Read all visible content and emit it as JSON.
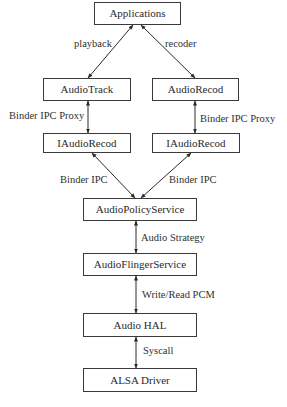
{
  "diagram": {
    "type": "architecture-stack",
    "nodes": {
      "applications": "Applications",
      "audio_track": "AudioTrack",
      "audio_record": "AudioRecod",
      "iaudio_record_left": "IAudioRecod",
      "iaudio_record_right": "IAudioRecod",
      "audio_policy_service": "AudioPolicyService",
      "audio_flinger_service": "AudioFlingerService",
      "audio_hal": "Audio HAL",
      "alsa_driver": "ALSA Driver"
    },
    "edges": {
      "playback": "playback",
      "recoder": "recoder",
      "binder_ipc_proxy_left": "Binder IPC Proxy",
      "binder_ipc_proxy_right": "Binder IPC Proxy",
      "binder_ipc_left": "Binder IPC",
      "binder_ipc_right": "Binder IPC",
      "audio_strategy": "Audio Strategy",
      "write_read_pcm": "Write/Read PCM",
      "syscall": "Syscall"
    },
    "connections": [
      {
        "from": "applications",
        "to": "audio_track",
        "label": "playback",
        "bidirectional": true
      },
      {
        "from": "applications",
        "to": "audio_record",
        "label": "recoder",
        "bidirectional": true
      },
      {
        "from": "audio_track",
        "to": "iaudio_record_left",
        "label": "Binder IPC Proxy",
        "bidirectional": true
      },
      {
        "from": "audio_record",
        "to": "iaudio_record_right",
        "label": "Binder IPC Proxy",
        "bidirectional": true
      },
      {
        "from": "iaudio_record_left",
        "to": "audio_policy_service",
        "label": "Binder IPC",
        "bidirectional": true
      },
      {
        "from": "iaudio_record_right",
        "to": "audio_policy_service",
        "label": "Binder IPC",
        "bidirectional": true
      },
      {
        "from": "audio_policy_service",
        "to": "audio_flinger_service",
        "label": "Audio Strategy",
        "bidirectional": true
      },
      {
        "from": "audio_flinger_service",
        "to": "audio_hal",
        "label": "Write/Read PCM",
        "bidirectional": true
      },
      {
        "from": "audio_hal",
        "to": "alsa_driver",
        "label": "Syscall",
        "bidirectional": true
      }
    ],
    "colors": {
      "line": "#2a2a2a",
      "box_border": "#3a3a3a",
      "background": "#ffffff"
    }
  }
}
